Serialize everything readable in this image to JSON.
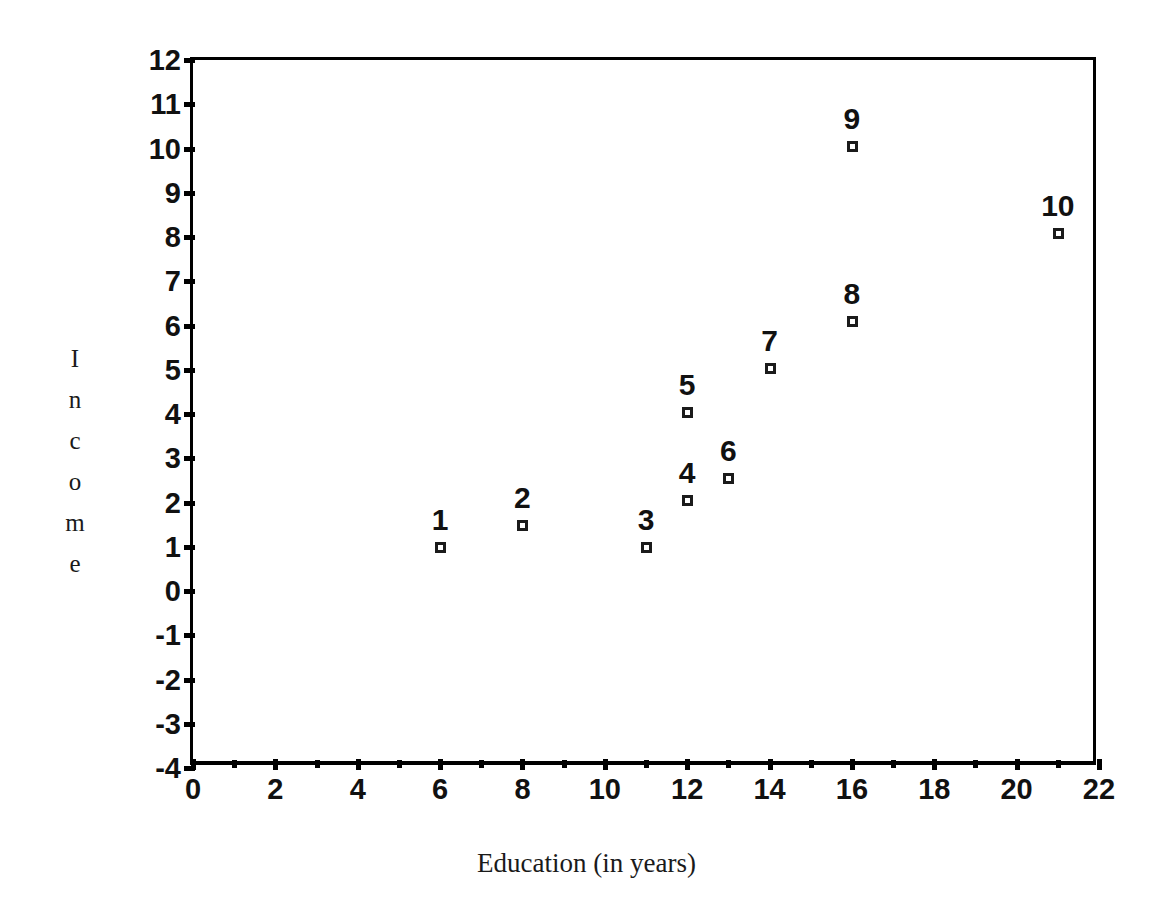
{
  "chart_data": {
    "type": "scatter",
    "title": "",
    "xlabel": "Education (in years)",
    "ylabel": "Income",
    "ylabel_letters": [
      "I",
      "n",
      "c",
      "o",
      "m",
      "e"
    ],
    "xlim": [
      0,
      22
    ],
    "ylim": [
      -4,
      12
    ],
    "xticks": [
      0,
      2,
      4,
      6,
      8,
      10,
      12,
      14,
      16,
      18,
      20,
      22
    ],
    "xtick_labels": [
      "0",
      "2",
      "4",
      "6",
      "8",
      "10",
      "12",
      "14",
      "16",
      "18",
      "20",
      "22"
    ],
    "x_minor_ticks": [
      1,
      3,
      5,
      7,
      9,
      11,
      13,
      15,
      17,
      19,
      21
    ],
    "yticks": [
      -4,
      -3,
      -2,
      -1,
      0,
      1,
      2,
      3,
      4,
      5,
      6,
      7,
      8,
      9,
      10,
      11,
      12
    ],
    "ytick_labels": [
      "-4",
      "-3",
      "-2",
      "-1",
      "0",
      "1",
      "2",
      "3",
      "4",
      "5",
      "6",
      "7",
      "8",
      "9",
      "10",
      "11",
      "12"
    ],
    "grid": false,
    "legend": false,
    "marker": "open-square",
    "point_label_position": "above",
    "points": [
      {
        "label": "1",
        "x": 6,
        "y": 1.0
      },
      {
        "label": "2",
        "x": 8,
        "y": 1.5
      },
      {
        "label": "3",
        "x": 11,
        "y": 1.0
      },
      {
        "label": "4",
        "x": 12,
        "y": 2.05
      },
      {
        "label": "5",
        "x": 12,
        "y": 4.05
      },
      {
        "label": "6",
        "x": 13,
        "y": 2.55
      },
      {
        "label": "7",
        "x": 14,
        "y": 5.05
      },
      {
        "label": "8",
        "x": 16,
        "y": 6.1
      },
      {
        "label": "9",
        "x": 16,
        "y": 10.05
      },
      {
        "label": "10",
        "x": 21,
        "y": 8.1
      }
    ],
    "colors": {
      "axis": "#000000",
      "marker_edge": "#1b1b1b",
      "marker_fill": "#ffffff",
      "text": "#111111",
      "background": "#ffffff"
    }
  }
}
